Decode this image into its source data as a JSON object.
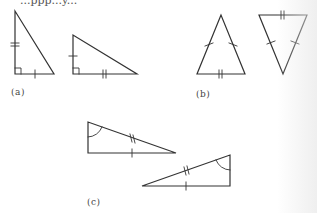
{
  "figure": {
    "header_text_cropped": "...ppp...y...",
    "stroke_color": "#333333",
    "background": "#ffffff",
    "panels": [
      {
        "id": "a",
        "label": "(a)",
        "description": "Two right triangles; congruent legs marked with tick marks",
        "triangles": [
          {
            "vertices": [
              [
                15,
                11
              ],
              [
                15,
                74
              ],
              [
                54,
                74
              ]
            ],
            "right_angle_at": [
              15,
              74
            ],
            "marks": {
              "vertical_leg": 2,
              "horizontal_leg": 1
            }
          },
          {
            "vertices": [
              [
                73,
                35
              ],
              [
                73,
                74
              ],
              [
                137,
                74
              ]
            ],
            "right_angle_at": [
              73,
              74
            ],
            "marks": {
              "vertical_leg": 1,
              "horizontal_leg": 2
            }
          }
        ]
      },
      {
        "id": "b",
        "label": "(b)",
        "description": "Two isosceles triangles; equal legs single-tick, base double-tick",
        "triangles": [
          {
            "vertices": [
              [
                221,
                15
              ],
              [
                197,
                74
              ],
              [
                245,
                74
              ]
            ],
            "marks": {
              "left_side": 1,
              "right_side": 1,
              "base": 2
            }
          },
          {
            "vertices": [
              [
                259,
                15
              ],
              [
                307,
                15
              ],
              [
                283,
                74
              ]
            ],
            "marks": {
              "left_side": 1,
              "right_side": 1,
              "base": 2
            }
          }
        ]
      },
      {
        "id": "c",
        "label": "(c)",
        "description": "Two right triangles with marked angle, hypotenuse double-tick, leg single-tick",
        "triangles": [
          {
            "vertices": [
              [
                88,
                122
              ],
              [
                88,
                153
              ],
              [
                176,
                153
              ]
            ],
            "angle_arc_at": [
              88,
              122
            ],
            "marks": {
              "hypotenuse": 2,
              "horizontal_leg": 1
            }
          },
          {
            "vertices": [
              [
                142,
                186
              ],
              [
                230,
                155
              ],
              [
                230,
                186
              ]
            ],
            "angle_arc_at": [
              230,
              155
            ],
            "marks": {
              "hypotenuse": 2,
              "horizontal_leg": 1
            }
          }
        ]
      }
    ]
  }
}
